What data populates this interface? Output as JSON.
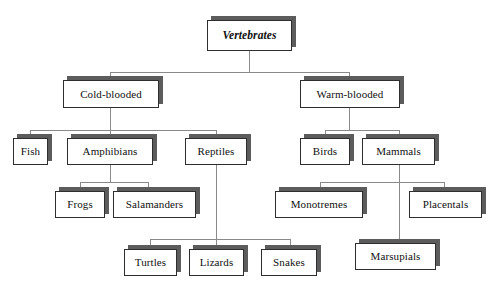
{
  "diagram": {
    "type": "hierarchy-tree",
    "orientation": "top-down",
    "background_color": "#ffffff",
    "box_fill_color": "#ffffff",
    "box_border_color": "#2e2e2e",
    "box_shadow_color": "#5c5c5c",
    "connector_color": "#8a8a8a",
    "text_color": "#101010"
  },
  "nodes": {
    "vertebrates": {
      "label": "Vertebrates",
      "level": 1,
      "emphasis": "bold-italic"
    },
    "cold_blooded": {
      "label": "Cold-blooded",
      "level": 2,
      "emphasis": "normal"
    },
    "warm_blooded": {
      "label": "Warm-blooded",
      "level": 2,
      "emphasis": "normal"
    },
    "fish": {
      "label": "Fish",
      "level": 3,
      "emphasis": "normal"
    },
    "amphibians": {
      "label": "Amphibians",
      "level": 3,
      "emphasis": "normal"
    },
    "reptiles": {
      "label": "Reptiles",
      "level": 3,
      "emphasis": "normal"
    },
    "birds": {
      "label": "Birds",
      "level": 3,
      "emphasis": "normal"
    },
    "mammals": {
      "label": "Mammals",
      "level": 3,
      "emphasis": "normal"
    },
    "frogs": {
      "label": "Frogs",
      "level": 4,
      "emphasis": "normal"
    },
    "salamanders": {
      "label": "Salamanders",
      "level": 4,
      "emphasis": "normal"
    },
    "monotremes": {
      "label": "Monotremes",
      "level": 4,
      "emphasis": "normal"
    },
    "placentals": {
      "label": "Placentals",
      "level": 4,
      "emphasis": "normal"
    },
    "turtles": {
      "label": "Turtles",
      "level": 5,
      "emphasis": "normal"
    },
    "lizards": {
      "label": "Lizards",
      "level": 5,
      "emphasis": "normal"
    },
    "snakes": {
      "label": "Snakes",
      "level": 5,
      "emphasis": "normal"
    },
    "marsupials": {
      "label": "Marsupials",
      "level": 5,
      "emphasis": "normal"
    }
  },
  "edges": [
    {
      "from": "vertebrates",
      "to": "cold_blooded"
    },
    {
      "from": "vertebrates",
      "to": "warm_blooded"
    },
    {
      "from": "cold_blooded",
      "to": "fish"
    },
    {
      "from": "cold_blooded",
      "to": "amphibians"
    },
    {
      "from": "cold_blooded",
      "to": "reptiles"
    },
    {
      "from": "warm_blooded",
      "to": "birds"
    },
    {
      "from": "warm_blooded",
      "to": "mammals"
    },
    {
      "from": "amphibians",
      "to": "frogs"
    },
    {
      "from": "amphibians",
      "to": "salamanders"
    },
    {
      "from": "reptiles",
      "to": "turtles"
    },
    {
      "from": "reptiles",
      "to": "lizards"
    },
    {
      "from": "reptiles",
      "to": "snakes"
    },
    {
      "from": "mammals",
      "to": "monotremes"
    },
    {
      "from": "mammals",
      "to": "placentals"
    },
    {
      "from": "mammals",
      "to": "marsupials"
    }
  ]
}
